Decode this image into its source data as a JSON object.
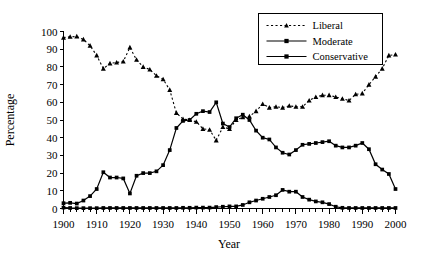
{
  "chart_data": {
    "type": "line",
    "title": "",
    "xlabel": "Year",
    "ylabel": "Percentage",
    "xlim": [
      1900,
      2000
    ],
    "ylim": [
      0,
      100
    ],
    "xticks": [
      1900,
      1910,
      1920,
      1930,
      1940,
      1950,
      1960,
      1970,
      1980,
      1990,
      2000
    ],
    "xtick_labels": [
      "1900",
      "1910",
      "1920",
      "1930",
      "1940",
      "1950",
      "1960",
      "1970",
      "1980",
      "1990",
      "2000"
    ],
    "yticks": [
      0,
      10,
      20,
      30,
      40,
      50,
      60,
      70,
      80,
      90,
      100
    ],
    "ytick_labels": [
      "0",
      "10",
      "20",
      "30",
      "40",
      "50",
      "60",
      "70",
      "80",
      "90",
      "100"
    ],
    "minor_xtick_step": 2,
    "grid": false,
    "legend_position": "top-right",
    "x": [
      1900,
      1902,
      1904,
      1906,
      1908,
      1910,
      1912,
      1914,
      1916,
      1918,
      1920,
      1922,
      1924,
      1926,
      1928,
      1930,
      1932,
      1934,
      1936,
      1938,
      1940,
      1942,
      1944,
      1946,
      1948,
      1950,
      1952,
      1954,
      1956,
      1958,
      1960,
      1962,
      1964,
      1966,
      1968,
      1970,
      1972,
      1974,
      1976,
      1978,
      1980,
      1982,
      1984,
      1986,
      1988,
      1990,
      1992,
      1994,
      1996,
      1998,
      2000
    ],
    "series": [
      {
        "name": "Liberal",
        "marker": "triangle",
        "line_style": "dotted",
        "color": "#000000",
        "values": [
          96.5,
          97.0,
          97.2,
          95.5,
          92.0,
          86.5,
          79.0,
          82.0,
          82.5,
          83.0,
          91.0,
          84.0,
          80.0,
          78.5,
          75.0,
          73.0,
          67.0,
          54.0,
          50.5,
          50.0,
          49.0,
          45.0,
          44.5,
          38.5,
          46.0,
          45.0,
          50.0,
          51.5,
          52.0,
          55.0,
          59.0,
          57.0,
          57.5,
          57.0,
          58.0,
          57.5,
          57.5,
          61.0,
          63.0,
          64.0,
          64.0,
          63.0,
          62.0,
          61.0,
          64.5,
          65.0,
          70.0,
          74.5,
          79.0,
          86.5,
          87.0
        ]
      },
      {
        "name": "Moderate",
        "marker": "square",
        "line_style": "solid",
        "color": "#000000",
        "values": [
          3.0,
          3.2,
          2.8,
          4.5,
          7.0,
          11.0,
          20.5,
          17.5,
          17.5,
          17.0,
          8.5,
          18.5,
          20.0,
          20.0,
          21.0,
          24.5,
          33.0,
          45.5,
          49.5,
          50.0,
          53.5,
          55.0,
          54.5,
          60.0,
          48.0,
          46.0,
          51.0,
          53.0,
          50.0,
          44.0,
          40.0,
          39.0,
          34.5,
          31.5,
          30.5,
          33.0,
          36.0,
          36.5,
          37.0,
          37.5,
          38.0,
          35.5,
          34.5,
          34.5,
          35.5,
          37.0,
          33.5,
          25.0,
          22.0,
          19.5,
          11.0
        ]
      },
      {
        "name": "Conservative",
        "marker": "square",
        "line_style": "solid",
        "color": "#000000",
        "values": [
          0.5,
          0.3,
          0.2,
          0.2,
          0.2,
          0.2,
          0.3,
          0.3,
          0.3,
          0.3,
          0.3,
          0.3,
          0.3,
          0.3,
          0.3,
          0.3,
          0.3,
          0.3,
          0.4,
          0.4,
          0.5,
          0.5,
          0.5,
          0.8,
          1.0,
          1.2,
          1.2,
          2.0,
          3.5,
          4.5,
          5.5,
          6.5,
          7.5,
          10.5,
          9.5,
          9.5,
          6.5,
          5.0,
          4.0,
          3.5,
          2.5,
          1.0,
          0.4,
          0.3,
          0.3,
          0.3,
          0.3,
          0.3,
          0.3,
          0.3,
          0.3
        ]
      }
    ],
    "legend_entries": [
      {
        "label": "Liberal",
        "marker": "triangle",
        "line_style": "dotted"
      },
      {
        "label": "Moderate",
        "marker": "square",
        "line_style": "solid"
      },
      {
        "label": "Conservative",
        "marker": "square",
        "line_style": "solid"
      }
    ]
  }
}
